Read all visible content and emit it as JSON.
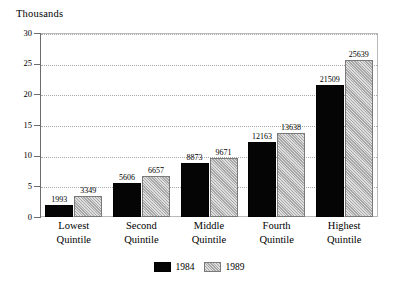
{
  "chart_data": {
    "type": "bar",
    "title": "",
    "unit_label": "Thousands",
    "xlabel": "",
    "ylabel": "Thousands",
    "ylim": [
      0,
      30
    ],
    "yticks": [
      0,
      5,
      10,
      15,
      20,
      25,
      30
    ],
    "ytick_labels": [
      "0",
      "5",
      "10",
      "15",
      "20",
      "25",
      "30"
    ],
    "grid": true,
    "grid_style": "dotted-horizontal",
    "legend_position": "bottom-center",
    "value_scale": 1000,
    "categories": [
      "Lowest Quintile",
      "Second Quintile",
      "Middle Quintile",
      "Fourth Quintile",
      "Highest Quintile"
    ],
    "category_lines": [
      [
        "Lowest",
        "Quintile"
      ],
      [
        "Second",
        "Quintile"
      ],
      [
        "Middle",
        "Quintile"
      ],
      [
        "Fourth",
        "Quintile"
      ],
      [
        "Highest",
        "Quintile"
      ]
    ],
    "series": [
      {
        "name": "1984",
        "color": "#050505",
        "values": [
          1993,
          3349,
          5606,
          6657,
          8873
        ],
        "values_by_category": [
          1993,
          5606,
          8873,
          12163,
          21509
        ],
        "labels": [
          "1993",
          "5606",
          "8873",
          "12163",
          "21509"
        ]
      },
      {
        "name": "1989",
        "color": "#b6b6b6",
        "values_by_category": [
          3349,
          6657,
          9671,
          13638,
          25639
        ],
        "labels": [
          "3349",
          "6657",
          "9671",
          "13638",
          "25639"
        ]
      }
    ]
  },
  "legend": {
    "items": [
      {
        "label": "1984",
        "color": "#050505"
      },
      {
        "label": "1989",
        "color": "#b6b6b6"
      }
    ]
  }
}
